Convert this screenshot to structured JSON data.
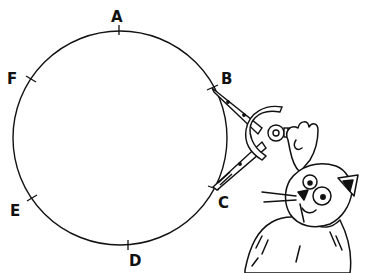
{
  "diagram": {
    "type": "circle-with-marked-points",
    "points": [
      {
        "label": "A",
        "x": 119,
        "y": 30,
        "lx": 116,
        "ly": 22
      },
      {
        "label": "B",
        "x": 212,
        "y": 88,
        "lx": 224,
        "ly": 82
      },
      {
        "label": "C",
        "x": 213,
        "y": 187,
        "lx": 222,
        "ly": 206
      },
      {
        "label": "D",
        "x": 129,
        "y": 245,
        "lx": 133,
        "ly": 265
      },
      {
        "label": "E",
        "x": 31,
        "y": 198,
        "lx": 15,
        "ly": 215
      },
      {
        "label": "F",
        "x": 31,
        "y": 78,
        "lx": 12,
        "ly": 81
      }
    ],
    "circle": {
      "cx": 120,
      "cy": 138,
      "r": 107
    },
    "tool": "drawing compass held by cartoon cat"
  }
}
